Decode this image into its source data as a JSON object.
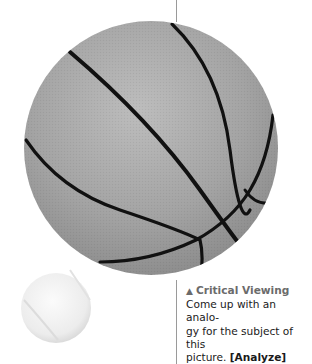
{
  "figure": {
    "basketball_icon": "basketball-image",
    "tennisball_icon": "tennis-ball-image"
  },
  "caption": {
    "marker": "▲",
    "heading": "Critical Viewing",
    "line1": "Come up with an analo-",
    "line2": "gy for the subject of this",
    "line3": "picture. ",
    "tag": "[Analyze]"
  },
  "colors": {
    "heading": "#6b6b6b",
    "body_text": "#1a1a1a",
    "ball_gray": "#a8a8a8",
    "seam": "#111111",
    "divider": "#9a9a9a"
  }
}
